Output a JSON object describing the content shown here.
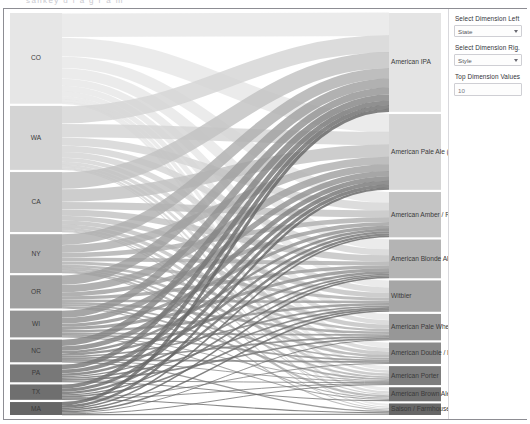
{
  "top_strip_text": "sankey  d i a g r a m",
  "panel": {
    "controls": [
      {
        "name": "select-dimension-left",
        "label": "Select Dimension Left",
        "value": "State",
        "type": "select"
      },
      {
        "name": "select-dimension-right",
        "label": "Select Dimension Rig.",
        "value": "Style",
        "type": "select"
      },
      {
        "name": "top-dimension-values",
        "label": "Top Dimension Values",
        "value": "10",
        "type": "text"
      }
    ]
  },
  "colors": {
    "node_light": "#e3e3e3",
    "node_dark": "#6f6f6f",
    "border": "#8d8d93",
    "label_text": "#3a3a3a",
    "panel_bg": "#ffffff"
  },
  "chart_data": {
    "type": "sankey",
    "title": "",
    "xlabel": "",
    "ylabel": "",
    "left_dimension": "State",
    "right_dimension": "Style",
    "top_n": 10,
    "left_nodes": [
      {
        "id": "CO",
        "label": "CO",
        "value": 112,
        "color": "#e6e6e6"
      },
      {
        "id": "WA",
        "label": "WA",
        "value": 79,
        "color": "#d4d4d4"
      },
      {
        "id": "CA",
        "label": "CA",
        "value": 74,
        "color": "#c2c2c2"
      },
      {
        "id": "NY",
        "label": "NY",
        "value": 48,
        "color": "#b0b0b0"
      },
      {
        "id": "OR",
        "label": "OR",
        "value": 41,
        "color": "#a0a0a0"
      },
      {
        "id": "WI",
        "label": "WI",
        "value": 33,
        "color": "#929292"
      },
      {
        "id": "NC",
        "label": "NC",
        "value": 28,
        "color": "#848484"
      },
      {
        "id": "PA",
        "label": "PA",
        "value": 22,
        "color": "#787878"
      },
      {
        "id": "TX",
        "label": "TX",
        "value": 19,
        "color": "#6f6f6f"
      },
      {
        "id": "MA",
        "label": "MA",
        "value": 16,
        "color": "#666666"
      }
    ],
    "right_nodes": [
      {
        "id": "american-ipa",
        "label": "American IPA",
        "value": 120,
        "color": "#e4e4e4"
      },
      {
        "id": "american-pale-ale",
        "label": "American Pale Ale (APA)",
        "value": 92,
        "color": "#d6d6d6"
      },
      {
        "id": "american-amber-red",
        "label": "American Amber / Red A",
        "value": 55,
        "color": "#c4c4c4"
      },
      {
        "id": "american-blonde-ale",
        "label": "American Blonde Ale",
        "value": 47,
        "color": "#b4b4b4"
      },
      {
        "id": "witbier",
        "label": "Witbier",
        "value": 38,
        "color": "#a6a6a6"
      },
      {
        "id": "american-pale-wheat",
        "label": "American Pale Wheat Al",
        "value": 32,
        "color": "#979797"
      },
      {
        "id": "american-double-imperial",
        "label": "American Double / Imper",
        "value": 26,
        "color": "#8a8a8a"
      },
      {
        "id": "american-porter",
        "label": "American Porter",
        "value": 23,
        "color": "#7d7d7d"
      },
      {
        "id": "american-brown-ale",
        "label": "American Brown Ale",
        "value": 17,
        "color": "#717171"
      },
      {
        "id": "saison-farmhouse-ale",
        "label": "Saison / Farmhouse Ale",
        "value": 14,
        "color": "#676767"
      }
    ],
    "links": [
      {
        "source": "CO",
        "target": "american-ipa",
        "value": 30
      },
      {
        "source": "CO",
        "target": "american-pale-ale",
        "value": 24
      },
      {
        "source": "CO",
        "target": "american-amber-red",
        "value": 14
      },
      {
        "source": "CO",
        "target": "american-blonde-ale",
        "value": 13
      },
      {
        "source": "CO",
        "target": "witbier",
        "value": 9
      },
      {
        "source": "CO",
        "target": "american-pale-wheat",
        "value": 7
      },
      {
        "source": "CO",
        "target": "american-double-imperial",
        "value": 6
      },
      {
        "source": "CO",
        "target": "american-porter",
        "value": 4
      },
      {
        "source": "CO",
        "target": "american-brown-ale",
        "value": 3
      },
      {
        "source": "CO",
        "target": "saison-farmhouse-ale",
        "value": 2
      },
      {
        "source": "WA",
        "target": "american-ipa",
        "value": 22
      },
      {
        "source": "WA",
        "target": "american-pale-ale",
        "value": 17
      },
      {
        "source": "WA",
        "target": "american-amber-red",
        "value": 10
      },
      {
        "source": "WA",
        "target": "american-blonde-ale",
        "value": 8
      },
      {
        "source": "WA",
        "target": "witbier",
        "value": 7
      },
      {
        "source": "WA",
        "target": "american-pale-wheat",
        "value": 5
      },
      {
        "source": "WA",
        "target": "american-double-imperial",
        "value": 4
      },
      {
        "source": "WA",
        "target": "american-porter",
        "value": 3
      },
      {
        "source": "WA",
        "target": "american-brown-ale",
        "value": 2
      },
      {
        "source": "WA",
        "target": "saison-farmhouse-ale",
        "value": 1
      },
      {
        "source": "CA",
        "target": "american-ipa",
        "value": 21
      },
      {
        "source": "CA",
        "target": "american-pale-ale",
        "value": 16
      },
      {
        "source": "CA",
        "target": "american-amber-red",
        "value": 9
      },
      {
        "source": "CA",
        "target": "american-blonde-ale",
        "value": 8
      },
      {
        "source": "CA",
        "target": "witbier",
        "value": 6
      },
      {
        "source": "CA",
        "target": "american-pale-wheat",
        "value": 5
      },
      {
        "source": "CA",
        "target": "american-double-imperial",
        "value": 4
      },
      {
        "source": "CA",
        "target": "american-porter",
        "value": 3
      },
      {
        "source": "CA",
        "target": "american-brown-ale",
        "value": 1
      },
      {
        "source": "CA",
        "target": "saison-farmhouse-ale",
        "value": 1
      },
      {
        "source": "NY",
        "target": "american-ipa",
        "value": 14
      },
      {
        "source": "NY",
        "target": "american-pale-ale",
        "value": 10
      },
      {
        "source": "NY",
        "target": "american-amber-red",
        "value": 6
      },
      {
        "source": "NY",
        "target": "american-blonde-ale",
        "value": 5
      },
      {
        "source": "NY",
        "target": "witbier",
        "value": 4
      },
      {
        "source": "NY",
        "target": "american-pale-wheat",
        "value": 3
      },
      {
        "source": "NY",
        "target": "american-double-imperial",
        "value": 3
      },
      {
        "source": "NY",
        "target": "american-porter",
        "value": 2
      },
      {
        "source": "NY",
        "target": "american-brown-ale",
        "value": 2
      },
      {
        "source": "NY",
        "target": "saison-farmhouse-ale",
        "value": 1
      },
      {
        "source": "OR",
        "target": "american-ipa",
        "value": 12
      },
      {
        "source": "OR",
        "target": "american-pale-ale",
        "value": 9
      },
      {
        "source": "OR",
        "target": "american-amber-red",
        "value": 5
      },
      {
        "source": "OR",
        "target": "american-blonde-ale",
        "value": 4
      },
      {
        "source": "OR",
        "target": "witbier",
        "value": 3
      },
      {
        "source": "OR",
        "target": "american-pale-wheat",
        "value": 3
      },
      {
        "source": "OR",
        "target": "american-double-imperial",
        "value": 2
      },
      {
        "source": "OR",
        "target": "american-porter",
        "value": 2
      },
      {
        "source": "OR",
        "target": "american-brown-ale",
        "value": 1
      },
      {
        "source": "WI",
        "target": "american-ipa",
        "value": 9
      },
      {
        "source": "WI",
        "target": "american-pale-ale",
        "value": 7
      },
      {
        "source": "WI",
        "target": "american-amber-red",
        "value": 4
      },
      {
        "source": "WI",
        "target": "american-blonde-ale",
        "value": 4
      },
      {
        "source": "WI",
        "target": "witbier",
        "value": 3
      },
      {
        "source": "WI",
        "target": "american-pale-wheat",
        "value": 2
      },
      {
        "source": "WI",
        "target": "american-double-imperial",
        "value": 2
      },
      {
        "source": "WI",
        "target": "american-porter",
        "value": 1
      },
      {
        "source": "WI",
        "target": "american-brown-ale",
        "value": 1
      },
      {
        "source": "NC",
        "target": "american-ipa",
        "value": 8
      },
      {
        "source": "NC",
        "target": "american-pale-ale",
        "value": 6
      },
      {
        "source": "NC",
        "target": "american-amber-red",
        "value": 3
      },
      {
        "source": "NC",
        "target": "american-blonde-ale",
        "value": 3
      },
      {
        "source": "NC",
        "target": "witbier",
        "value": 2
      },
      {
        "source": "NC",
        "target": "american-pale-wheat",
        "value": 2
      },
      {
        "source": "NC",
        "target": "american-double-imperial",
        "value": 2
      },
      {
        "source": "NC",
        "target": "american-porter",
        "value": 1
      },
      {
        "source": "NC",
        "target": "saison-farmhouse-ale",
        "value": 1
      },
      {
        "source": "PA",
        "target": "american-ipa",
        "value": 6
      },
      {
        "source": "PA",
        "target": "american-pale-ale",
        "value": 5
      },
      {
        "source": "PA",
        "target": "american-amber-red",
        "value": 3
      },
      {
        "source": "PA",
        "target": "american-blonde-ale",
        "value": 2
      },
      {
        "source": "PA",
        "target": "witbier",
        "value": 2
      },
      {
        "source": "PA",
        "target": "american-pale-wheat",
        "value": 2
      },
      {
        "source": "PA",
        "target": "american-porter",
        "value": 1
      },
      {
        "source": "PA",
        "target": "american-brown-ale",
        "value": 1
      },
      {
        "source": "TX",
        "target": "american-ipa",
        "value": 5
      },
      {
        "source": "TX",
        "target": "american-pale-ale",
        "value": 4
      },
      {
        "source": "TX",
        "target": "american-amber-red",
        "value": 3
      },
      {
        "source": "TX",
        "target": "american-blonde-ale",
        "value": 2
      },
      {
        "source": "TX",
        "target": "witbier",
        "value": 2
      },
      {
        "source": "TX",
        "target": "american-double-imperial",
        "value": 1
      },
      {
        "source": "TX",
        "target": "american-porter",
        "value": 1
      },
      {
        "source": "TX",
        "target": "saison-farmhouse-ale",
        "value": 1
      },
      {
        "source": "MA",
        "target": "american-ipa",
        "value": 4
      },
      {
        "source": "MA",
        "target": "american-pale-ale",
        "value": 3
      },
      {
        "source": "MA",
        "target": "american-amber-red",
        "value": 2
      },
      {
        "source": "MA",
        "target": "american-blonde-ale",
        "value": 2
      },
      {
        "source": "MA",
        "target": "witbier",
        "value": 2
      },
      {
        "source": "MA",
        "target": "american-pale-wheat",
        "value": 1
      },
      {
        "source": "MA",
        "target": "american-porter",
        "value": 1
      },
      {
        "source": "MA",
        "target": "saison-farmhouse-ale",
        "value": 1
      }
    ]
  }
}
